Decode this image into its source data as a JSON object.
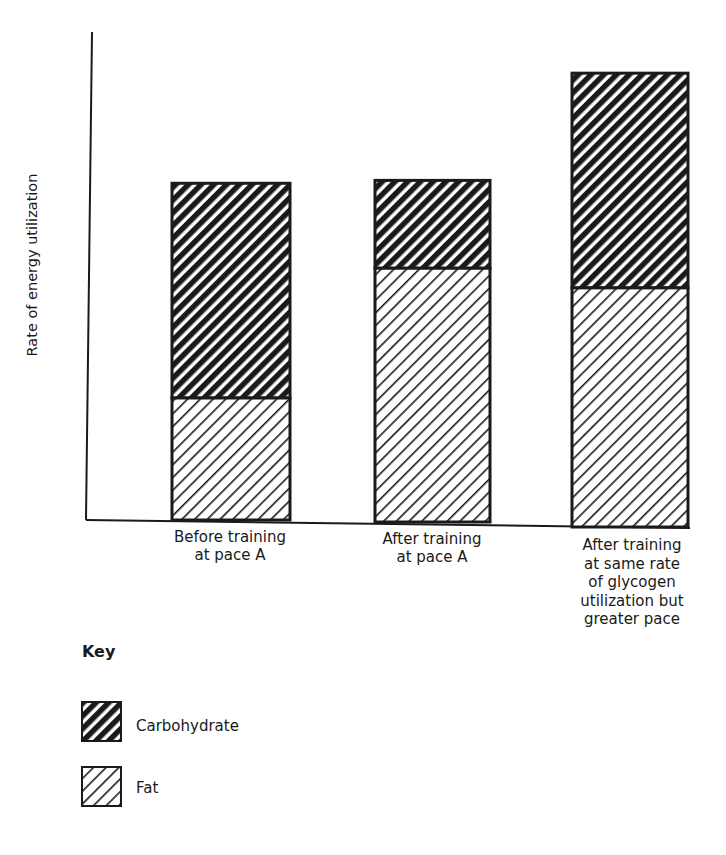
{
  "chart_data": {
    "type": "bar",
    "stacked": true,
    "title": "",
    "xlabel": "",
    "ylabel": "Rate of energy utilization",
    "y_ticks": [],
    "ylim": [
      0,
      100
    ],
    "grid": false,
    "value_units": "relative (no numeric scale shown; estimated as % of axis height)",
    "categories": [
      "Before training\nat pace A",
      "After training\nat pace A",
      "After training\nat same rate\nof glycogen\nutilization but\ngreater pace"
    ],
    "series": [
      {
        "name": "Fat",
        "pattern": "light-diagonal-hatch",
        "values": [
          25,
          52,
          49
        ]
      },
      {
        "name": "Carbohydrate",
        "pattern": "dark-diagonal-hatch",
        "values": [
          44,
          18,
          44
        ]
      }
    ],
    "totals": [
      69,
      70,
      93
    ],
    "legend": {
      "title": "Key",
      "position": "bottom-left",
      "entries": [
        "Carbohydrate",
        "Fat"
      ]
    }
  },
  "axis": {
    "ylabel": "Rate of energy utilization"
  },
  "categories": {
    "c0": "Before training\nat pace A",
    "c1": "After training\nat pace A",
    "c2": "After training\nat same rate\nof glycogen\nutilization but\ngreater pace"
  },
  "key": {
    "title": "Key",
    "carbohydrate": "Carbohydrate",
    "fat": "Fat"
  },
  "colors": {
    "ink": "#1a1a1a",
    "background": "#ffffff"
  }
}
